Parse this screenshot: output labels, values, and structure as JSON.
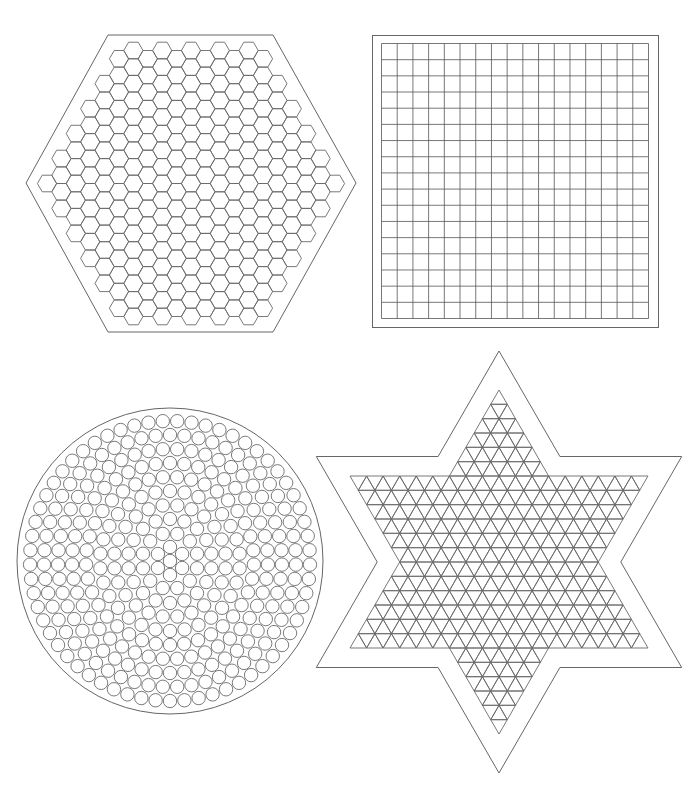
{
  "colors": {
    "background": "#ffffff",
    "outline": "#666666",
    "cell": "#6a6a6a",
    "grid": "#555555"
  },
  "boards": [
    {
      "id": "hexagon",
      "label": "Hexagon pegboard",
      "cell_shape": "hexagon",
      "outer_shape": "hexagon"
    },
    {
      "id": "square",
      "label": "Square pegboard",
      "cell_shape": "square",
      "outer_shape": "square",
      "columns": 17,
      "rows": 17
    },
    {
      "id": "circle",
      "label": "Round pegboard",
      "cell_shape": "circle",
      "outer_shape": "circle",
      "rings": 10,
      "center_peg": true
    },
    {
      "id": "star",
      "label": "Star pegboard",
      "cell_shape": "triangle",
      "outer_shape": "six-pointed-star"
    }
  ]
}
